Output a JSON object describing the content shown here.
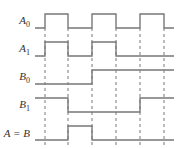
{
  "diagram": {
    "type": "timing-diagram",
    "colors": {
      "signal": "#777777",
      "dashed": "#555555",
      "label": "#333333"
    },
    "time_marks_x": [
      45,
      68,
      92,
      116,
      140,
      164
    ],
    "x_start": 35,
    "x_end": 174,
    "dashed_y_range": [
      28,
      145
    ],
    "signals": [
      {
        "name": "A0",
        "label_main": "A",
        "label_sub": "0",
        "high_y": 14,
        "low_y": 28,
        "levels": [
          0,
          1,
          0,
          1,
          0,
          1,
          0
        ]
      },
      {
        "name": "A1",
        "label_main": "A",
        "label_sub": "1",
        "high_y": 42,
        "low_y": 56,
        "levels": [
          0,
          1,
          0,
          1,
          0,
          0,
          0
        ]
      },
      {
        "name": "B0",
        "label_main": "B",
        "label_sub": "0",
        "high_y": 70,
        "low_y": 84,
        "levels": [
          0,
          0,
          0,
          1,
          1,
          1,
          1
        ]
      },
      {
        "name": "B1",
        "label_main": "B",
        "label_sub": "1",
        "high_y": 98,
        "low_y": 112,
        "levels": [
          1,
          1,
          0,
          0,
          0,
          1,
          1
        ]
      },
      {
        "name": "A=B",
        "label_main": "A = B",
        "label_sub": "",
        "high_y": 126,
        "low_y": 140,
        "levels": [
          0,
          0,
          1,
          0,
          0,
          0,
          0
        ]
      }
    ]
  }
}
